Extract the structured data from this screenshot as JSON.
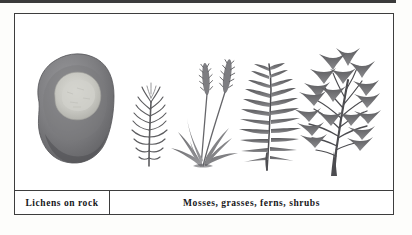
{
  "figure": {
    "type": "botanical-succession-illustration",
    "background_color": "#fdfdfb",
    "frame_color": "#3d3d3d",
    "top_rule_color": "#3a3a3a",
    "panels": [
      {
        "id": "lichens",
        "caption": "Lichens on rock",
        "subjects": [
          {
            "name": "rock-with-lichen",
            "description": "gray boulder bearing a pale lichen crust"
          }
        ]
      },
      {
        "id": "plants",
        "caption": "Mosses, grasses, ferns, shrubs",
        "subjects": [
          {
            "name": "moss-sprig",
            "description": "feathery moss shoot with fine needle branchlets"
          },
          {
            "name": "grass-clump",
            "description": "grass tuft with two seed heads and arching blades"
          },
          {
            "name": "fern-frond",
            "description": "fern frond with paired pinnae along a central rachis"
          },
          {
            "name": "shrub",
            "description": "branching woody shrub with lobed palmate leaves"
          }
        ]
      }
    ],
    "palette": {
      "rock_dark": "#6f6f72",
      "rock_mid": "#8b8b8e",
      "lichen_light": "#c9c9c4",
      "plant_dark": "#4a4a4d",
      "plant_mid": "#6d6d70",
      "plant_light": "#97979a"
    }
  },
  "captions": {
    "left": "Lichens on rock",
    "right": "Mosses, grasses, ferns, shrubs"
  }
}
